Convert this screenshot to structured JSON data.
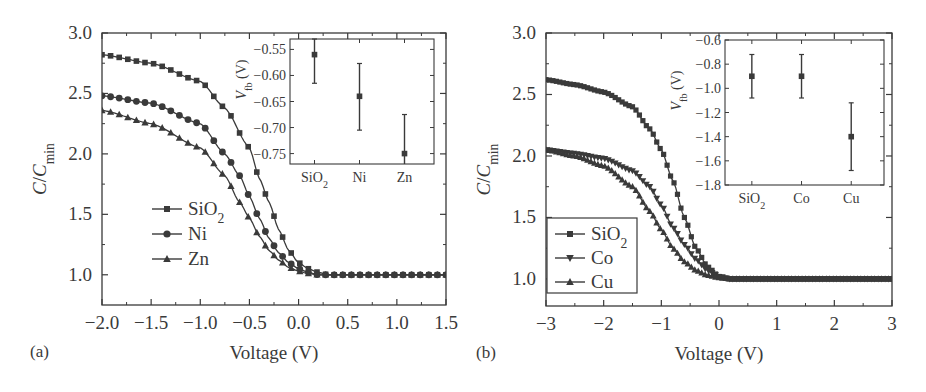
{
  "chart_data": [
    {
      "panel": "(a)",
      "type": "line",
      "title": "",
      "xlabel": "Voltage (V)",
      "ylabel": "C/C_min",
      "xlim": [
        -2.0,
        1.5
      ],
      "ylim": [
        0.75,
        3.0
      ],
      "xticks": [
        "-2.0",
        "-1.5",
        "-1.0",
        "-0.5",
        "0.0",
        "0.5",
        "1.0",
        "1.5"
      ],
      "yticks": [
        "1.0",
        "1.5",
        "2.0",
        "2.5",
        "3.0"
      ],
      "legend": {
        "position": "center-left",
        "boxed": false,
        "entries": [
          "SiO2",
          "Ni",
          "Zn"
        ]
      },
      "series": [
        {
          "name": "SiO2",
          "marker": "square",
          "x": [
            -2.0,
            -1.5,
            -1.0,
            -0.75,
            -0.5,
            -0.4,
            -0.3,
            -0.2,
            -0.1,
            0.0,
            0.1,
            0.2,
            0.3,
            0.5,
            1.0,
            1.5
          ],
          "y": [
            2.82,
            2.75,
            2.6,
            2.38,
            2.05,
            1.8,
            1.6,
            1.37,
            1.2,
            1.1,
            1.05,
            1.02,
            1.0,
            1.0,
            1.0,
            1.0
          ]
        },
        {
          "name": "Ni",
          "marker": "circle",
          "x": [
            -2.0,
            -1.5,
            -1.0,
            -0.75,
            -0.6,
            -0.5,
            -0.4,
            -0.3,
            -0.2,
            -0.1,
            0.0,
            0.1,
            0.2,
            0.5,
            1.0,
            1.5
          ],
          "y": [
            2.48,
            2.42,
            2.25,
            2.0,
            1.82,
            1.65,
            1.47,
            1.3,
            1.18,
            1.1,
            1.05,
            1.02,
            1.0,
            1.0,
            1.0,
            1.0
          ]
        },
        {
          "name": "Zn",
          "marker": "triangle-up",
          "x": [
            -2.0,
            -1.5,
            -1.0,
            -0.75,
            -0.6,
            -0.5,
            -0.4,
            -0.3,
            -0.2,
            -0.1,
            0.0,
            0.1,
            0.2,
            0.5,
            1.0,
            1.5
          ],
          "y": [
            2.36,
            2.25,
            2.05,
            1.82,
            1.6,
            1.47,
            1.32,
            1.2,
            1.12,
            1.06,
            1.03,
            1.01,
            1.0,
            1.0,
            1.0,
            1.0
          ]
        }
      ],
      "inset": {
        "type": "errorbar",
        "ylabel": "V_fb (V)",
        "categories": [
          "SiO2",
          "Ni",
          "Zn"
        ],
        "ylim": [
          -0.77,
          -0.53
        ],
        "yticks": [
          "-0.55",
          "-0.60",
          "-0.65",
          "-0.70",
          "-0.75"
        ],
        "values": [
          -0.56,
          -0.64,
          -0.75
        ],
        "err_low": [
          -0.615,
          -0.705,
          -0.78
        ],
        "err_high": [
          -0.53,
          -0.577,
          -0.675
        ]
      }
    },
    {
      "panel": "(b)",
      "type": "line",
      "title": "",
      "xlabel": "Voltage (V)",
      "ylabel": "C/C_min",
      "xlim": [
        -3,
        3
      ],
      "ylim": [
        0.78,
        3.0
      ],
      "xticks": [
        "-3",
        "-2",
        "-1",
        "0",
        "1",
        "2",
        "3"
      ],
      "yticks": [
        "1.0",
        "1.5",
        "2.0",
        "2.5",
        "3.0"
      ],
      "legend": {
        "position": "lower-left",
        "boxed": true,
        "entries": [
          "SiO2",
          "Co",
          "Cu"
        ]
      },
      "series": [
        {
          "name": "SiO2",
          "marker": "square",
          "x": [
            -3,
            -2.5,
            -2,
            -1.5,
            -1.2,
            -1.0,
            -0.8,
            -0.6,
            -0.4,
            -0.2,
            0.0,
            0.2,
            1,
            2,
            3
          ],
          "y": [
            2.62,
            2.58,
            2.52,
            2.4,
            2.22,
            2.05,
            1.8,
            1.5,
            1.25,
            1.1,
            1.02,
            1.0,
            1.0,
            1.0,
            1.0
          ]
        },
        {
          "name": "Co",
          "marker": "triangle-down",
          "x": [
            -3,
            -2.5,
            -2,
            -1.5,
            -1.2,
            -1.0,
            -0.8,
            -0.6,
            -0.4,
            -0.2,
            0.0,
            0.2,
            1,
            2,
            3
          ],
          "y": [
            2.05,
            2.02,
            1.98,
            1.88,
            1.75,
            1.6,
            1.42,
            1.28,
            1.16,
            1.07,
            1.02,
            1.0,
            1.0,
            1.0,
            1.0
          ]
        },
        {
          "name": "Cu",
          "marker": "triangle-up",
          "x": [
            -3,
            -2.5,
            -2,
            -1.5,
            -1.2,
            -1.0,
            -0.8,
            -0.6,
            -0.4,
            -0.2,
            0.0,
            0.2,
            1,
            2,
            3
          ],
          "y": [
            2.05,
            2.0,
            1.92,
            1.75,
            1.55,
            1.4,
            1.25,
            1.14,
            1.07,
            1.03,
            1.01,
            1.0,
            1.0,
            1.0,
            1.0
          ]
        }
      ],
      "inset": {
        "type": "errorbar",
        "ylabel": "V_fb (V)",
        "categories": [
          "SiO2",
          "Co",
          "Cu"
        ],
        "ylim": [
          -1.8,
          -0.6
        ],
        "yticks": [
          "-0.6",
          "-0.8",
          "-1.0",
          "-1.2",
          "-1.4",
          "-1.6",
          "-1.8"
        ],
        "values": [
          -0.9,
          -0.9,
          -1.4
        ],
        "err_low": [
          -1.08,
          -1.08,
          -1.68
        ],
        "err_high": [
          -0.72,
          -0.72,
          -1.12
        ]
      }
    }
  ],
  "labels": {
    "panel_a": "(a)",
    "panel_b": "(b)",
    "xlabel": "Voltage (V)",
    "ylabel_main": "C/C",
    "ylabel_sub": "min",
    "inset_ylabel_main": "V",
    "inset_ylabel_sub": "fb",
    "inset_ylabel_unit": " (V)"
  },
  "colors": {
    "ink": "#3a3a3a",
    "background": "#ffffff"
  }
}
